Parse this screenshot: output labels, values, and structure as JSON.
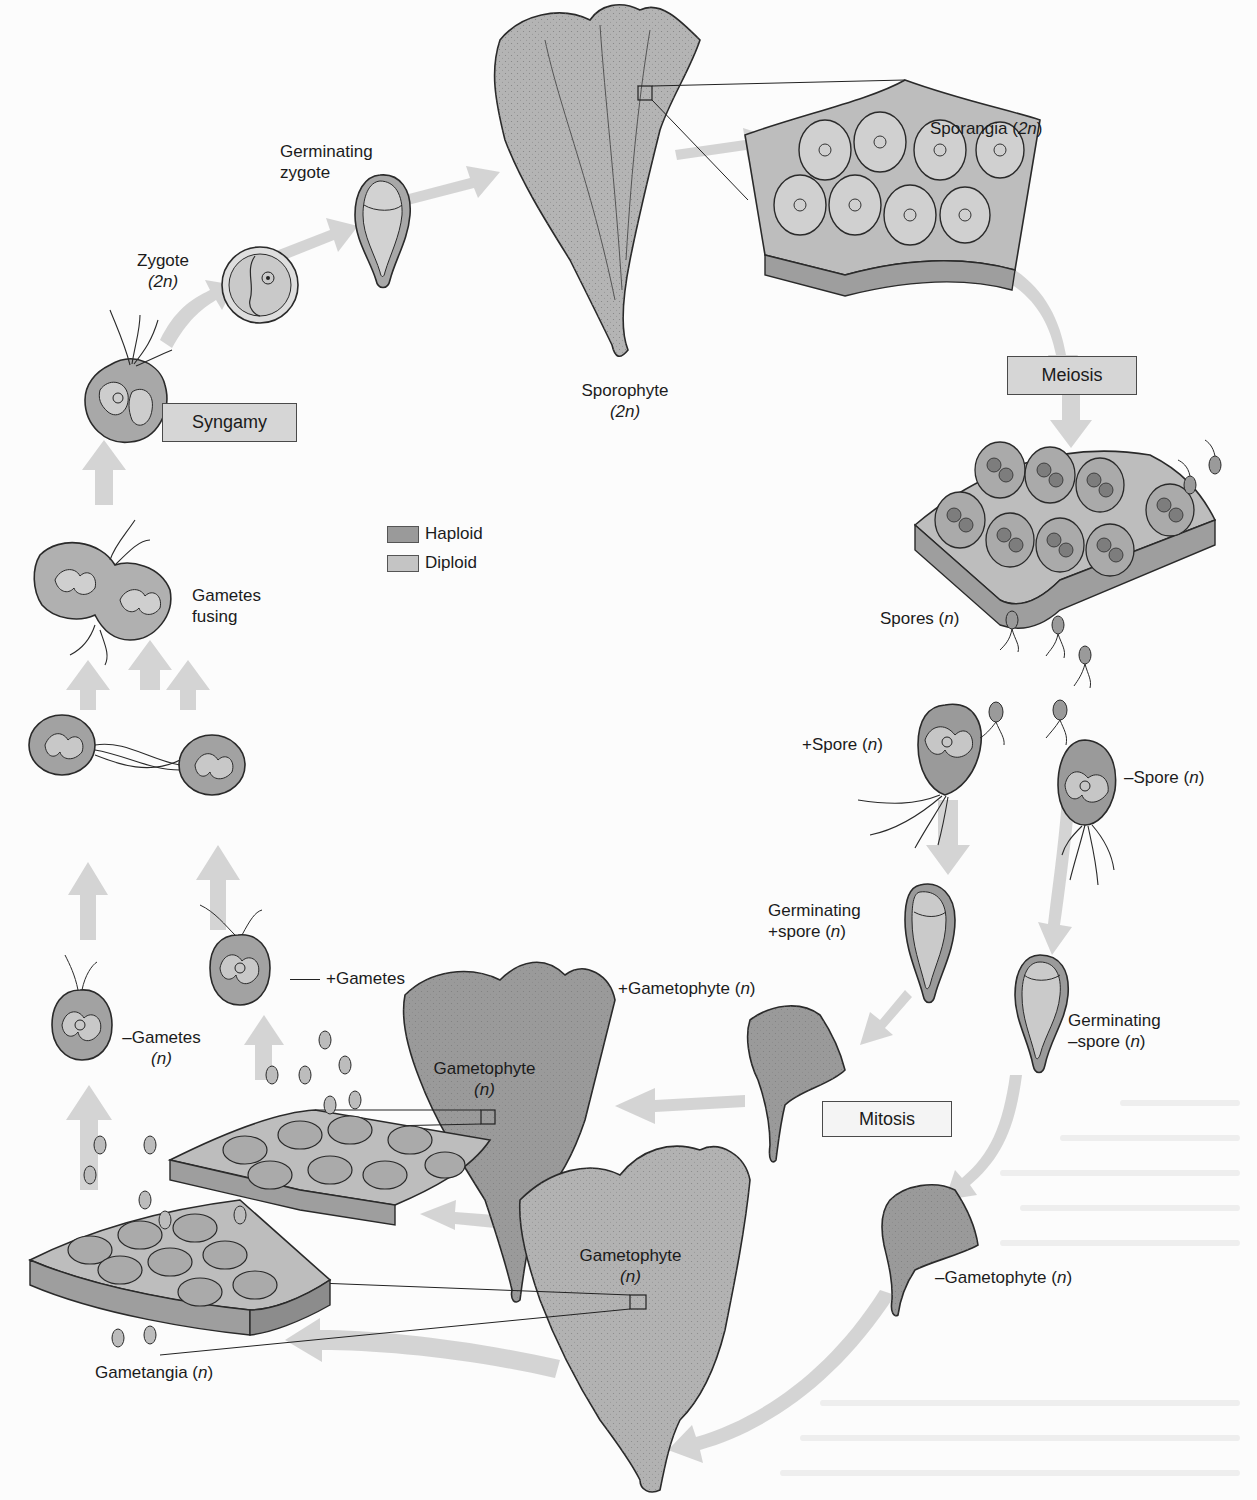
{
  "diagram": {
    "type": "life-cycle",
    "colors": {
      "haploid": "#9a9a9a",
      "diploid": "#c4c4c4",
      "arrow": "#cfcfcf",
      "thallus": "#a9a9a9",
      "box_fill": "#d6d6d6",
      "outline": "#2a2a2a"
    },
    "legend": {
      "haploid": "Haploid",
      "diploid": "Diploid"
    },
    "process_boxes": {
      "syngamy": "Syngamy",
      "meiosis": "Meiosis",
      "mitosis": "Mitosis"
    },
    "labels": {
      "sporangia": {
        "text": "Sporangia (",
        "ploidy": "2n",
        "close": ")"
      },
      "sporophyte": {
        "line1": "Sporophyte",
        "ploidy": "(2n)"
      },
      "germinating_zygote": {
        "line1": "Germinating",
        "line2": "zygote"
      },
      "zygote": {
        "line1": "Zygote",
        "ploidy": "(2n)"
      },
      "gametes_fusing": {
        "line1": "Gametes",
        "line2": "fusing"
      },
      "spores": {
        "text": "Spores (",
        "ploidy": "n",
        "close": ")"
      },
      "plus_spore": {
        "text": "+Spore (",
        "ploidy": "n",
        "close": ")"
      },
      "minus_spore": {
        "text": "–Spore (",
        "ploidy": "n",
        "close": ")"
      },
      "germinating_plus_spore": {
        "line1": "Germinating",
        "line2": "+spore (",
        "ploidy": "n",
        "close": ")"
      },
      "germinating_minus_spore": {
        "line1": "Germinating",
        "line2": "–spore (",
        "ploidy": "n",
        "close": ")"
      },
      "plus_gametophyte": {
        "text": "+Gametophyte (",
        "ploidy": "n",
        "close": ")"
      },
      "minus_gametophyte": {
        "text": "–Gametophyte (",
        "ploidy": "n",
        "close": ")"
      },
      "gametophyte_upper": {
        "line1": "Gametophyte",
        "ploidy": "(n)"
      },
      "gametophyte_lower": {
        "line1": "Gametophyte",
        "ploidy": "(n)"
      },
      "plus_gametes": {
        "text": "+Gametes"
      },
      "minus_gametes": {
        "line1": "–Gametes",
        "ploidy": "(n)"
      },
      "gametangia": {
        "text": "Gametangia (",
        "ploidy": "n",
        "close": ")"
      }
    },
    "stages_in_order": [
      "Sporophyte (2n)",
      "Sporangia (2n)",
      "Meiosis",
      "Spores (n)",
      "+Spore (n) / –Spore (n)",
      "Germinating +spore (n) / Germinating –spore (n)",
      "Mitosis",
      "+Gametophyte (n) / –Gametophyte (n)",
      "Gametangia (n)",
      "+Gametes / –Gametes (n)",
      "Gametes fusing",
      "Syngamy",
      "Zygote (2n)",
      "Germinating zygote"
    ]
  }
}
